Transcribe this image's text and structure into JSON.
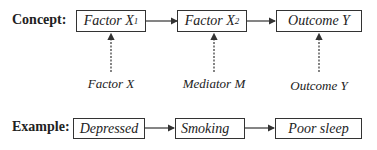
{
  "concept": {
    "label": "Concept:",
    "boxes": [
      {
        "text": "Factor X",
        "sub": "1"
      },
      {
        "text": "Factor X",
        "sub": "2"
      },
      {
        "text": "Outcome Y",
        "sub": ""
      }
    ],
    "roles": [
      "Factor X",
      "Mediator M",
      "Outcome Y"
    ]
  },
  "example": {
    "label": "Example:",
    "boxes": [
      "Depressed",
      "Smoking",
      "Poor sleep"
    ]
  }
}
